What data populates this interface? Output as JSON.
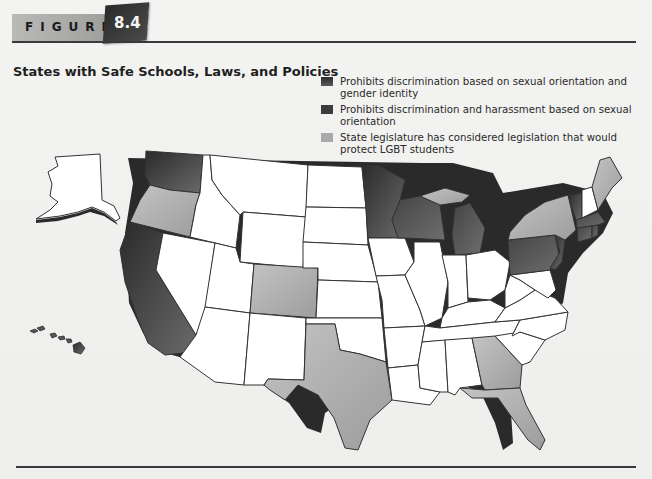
{
  "figure": {
    "label": "FIGURE",
    "number": "8.4",
    "title": "States with Safe Schools, Laws, and Policies"
  },
  "legend": {
    "items": [
      {
        "id": "cat1",
        "label": "Prohibits discrimination based on sexual orientation and gender identity",
        "color": "#3a3a3a"
      },
      {
        "id": "cat2",
        "label": "Prohibits discrimination and harassment based on sexual orientation",
        "color": "#4a4a4a"
      },
      {
        "id": "cat3",
        "label": "State legislature has considered legislation that would protect LGBT students",
        "color": "#a9a9a9"
      }
    ]
  },
  "colors": {
    "cat1": "#3d3d3d",
    "cat2": "#575757",
    "cat3": "#b0b0b0",
    "none": "#ffffff",
    "border": "#333333",
    "shadow": "#2a2a2a"
  },
  "map_data": {
    "categories": {
      "prohibits_so_and_gi": [
        "Washington",
        "California",
        "Minnesota",
        "New Jersey",
        "Vermont",
        "Hawaii"
      ],
      "prohibits_discrimination_and_harassment_so": [
        "Wisconsin",
        "Michigan (lower)",
        "Pennsylvania",
        "Massachusetts",
        "Connecticut",
        "Rhode Island"
      ],
      "considered_legislation": [
        "Oregon",
        "Colorado",
        "Texas",
        "Georgia",
        "Florida",
        "New York",
        "Maine",
        "Michigan (upper peninsula)"
      ],
      "none": [
        "Alaska",
        "Idaho",
        "Montana",
        "Wyoming",
        "Nevada",
        "Utah",
        "Arizona",
        "New Mexico",
        "North Dakota",
        "South Dakota",
        "Nebraska",
        "Kansas",
        "Oklahoma",
        "Iowa",
        "Missouri",
        "Arkansas",
        "Louisiana",
        "Illinois",
        "Indiana",
        "Ohio",
        "Kentucky",
        "Tennessee",
        "Mississippi",
        "Alabama",
        "West Virginia",
        "Virginia",
        "North Carolina",
        "South Carolina",
        "Maryland",
        "Delaware",
        "New Hampshire"
      ]
    }
  }
}
